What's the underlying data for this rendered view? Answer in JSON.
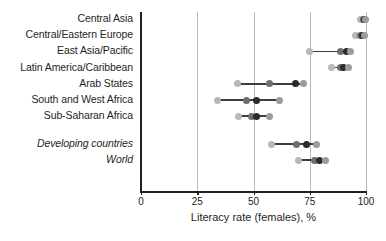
{
  "chart_data": {
    "type": "scatter",
    "subtype": "dot-plot",
    "title": "",
    "xlabel": "Literacy rate (females), %",
    "ylabel": "",
    "xlim": [
      0,
      100
    ],
    "xticks": [
      0,
      25,
      50,
      75,
      100
    ],
    "xtick_labels": [
      "0",
      "25",
      "50",
      "75",
      "100"
    ],
    "grid": "vertical",
    "legend": "none",
    "series_colors": [
      "#b6b8ba",
      "#6d6e70",
      "#2b2b2d",
      "#9a9c9e"
    ],
    "categories": [
      {
        "label": "Central Asia",
        "style": "regular",
        "values": [
          97.5,
          98.8,
          99.2,
          99.6
        ]
      },
      {
        "label": "Central/Eastern Europe",
        "style": "regular",
        "values": [
          95.5,
          97.5,
          98.5,
          99.3
        ]
      },
      {
        "label": "East Asia/Pacific",
        "style": "regular",
        "values": [
          75.0,
          88.5,
          91.5,
          93.0
        ]
      },
      {
        "label": "Latin America/Caribbean",
        "style": "regular",
        "values": [
          84.5,
          88.5,
          90.0,
          92.0
        ]
      },
      {
        "label": "Arab States",
        "style": "regular",
        "values": [
          43.0,
          57.0,
          68.5,
          72.0
        ]
      },
      {
        "label": "South and West Africa",
        "style": "regular",
        "values": [
          34.0,
          47.0,
          51.5,
          61.5
        ]
      },
      {
        "label": "Sub-Saharan Africa",
        "style": "regular",
        "values": [
          43.5,
          49.0,
          51.5,
          57.0
        ]
      },
      {
        "label": "Developing countries",
        "style": "italic",
        "values": [
          58.0,
          69.0,
          73.5,
          78.0
        ]
      },
      {
        "label": "World",
        "style": "italic",
        "values": [
          70.0,
          77.0,
          79.5,
          82.0
        ]
      }
    ]
  },
  "axis": {
    "x_title": "Literacy rate (females), %"
  }
}
